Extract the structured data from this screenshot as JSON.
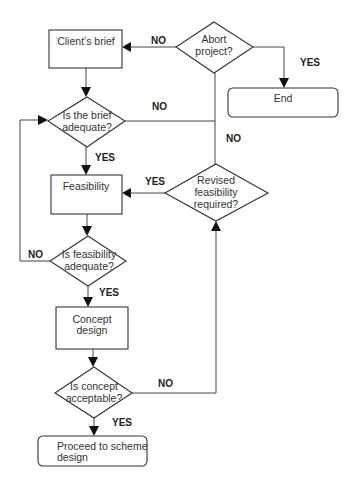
{
  "diagram": {
    "type": "flowchart",
    "nodes": {
      "clients_brief": {
        "label": "Client’s brief",
        "shape": "rectangle"
      },
      "abort_project": {
        "line1": "Abort",
        "line2": "project?",
        "shape": "diamond"
      },
      "end": {
        "label": "End",
        "shape": "rounded-rectangle"
      },
      "brief_adequate": {
        "line1": "Is the brief",
        "line2": "adequate?",
        "shape": "diamond"
      },
      "feasibility": {
        "label": "Feasibility",
        "shape": "rectangle"
      },
      "revised_feasibility": {
        "line1": "Revised",
        "line2": "feasibility",
        "line3": "required?",
        "shape": "diamond"
      },
      "feasibility_adequate": {
        "line1": "Is feasibility",
        "line2": "adequate?",
        "shape": "diamond"
      },
      "concept_design": {
        "line1": "Concept",
        "line2": "design",
        "shape": "rectangle"
      },
      "concept_acceptable": {
        "line1": "Is concept",
        "line2": "acceptable?",
        "shape": "diamond"
      },
      "proceed": {
        "line1": "Proceed to scheme",
        "line2": "design",
        "shape": "rounded-rectangle"
      }
    },
    "edges": {
      "abort_no": {
        "label": "NO",
        "from": "abort_project",
        "to": "clients_brief"
      },
      "abort_yes": {
        "label": "YES",
        "from": "abort_project",
        "to": "end"
      },
      "brief_no": {
        "label": "NO",
        "from": "brief_adequate",
        "to": "revised_feasibility"
      },
      "abort_down_no": {
        "label": "NO",
        "from": "abort_project",
        "to": "revised_feasibility"
      },
      "brief_yes": {
        "label": "YES",
        "from": "brief_adequate",
        "to": "feasibility"
      },
      "revised_yes": {
        "label": "YES",
        "from": "revised_feasibility",
        "to": "feasibility"
      },
      "feas_no": {
        "label": "NO",
        "from": "feasibility_adequate",
        "to": "brief_adequate"
      },
      "feas_yes": {
        "label": "YES",
        "from": "feasibility_adequate",
        "to": "concept_design"
      },
      "concept_no": {
        "label": "NO",
        "from": "concept_acceptable",
        "to": "revised_feasibility"
      },
      "concept_yes": {
        "label": "YES",
        "from": "concept_acceptable",
        "to": "proceed"
      }
    }
  }
}
